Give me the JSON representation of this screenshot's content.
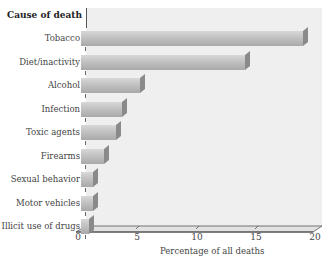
{
  "chart_data": {
    "type": "bar",
    "orientation": "horizontal",
    "style": "3d",
    "title": "",
    "ylabel": "Cause of death",
    "xlabel": "Percentage of all deaths",
    "categories": [
      "Tobacco",
      "Diet/inactivity",
      "Alcohol",
      "Infection",
      "Toxic agents",
      "Firearms",
      "Sexual behavior",
      "Motor vehicles",
      "Illicit use of drugs"
    ],
    "values": [
      19,
      14,
      5,
      3.5,
      3,
      2,
      1,
      1,
      0.7
    ],
    "xlim": [
      0,
      20
    ],
    "xticks": [
      "0",
      "5",
      "10",
      "15",
      "20"
    ],
    "grid": false,
    "legend": null
  },
  "header": "Cause of death",
  "rows": [
    {
      "label": "Tobacco"
    },
    {
      "label": "Diet/inactivity"
    },
    {
      "label": "Alcohol"
    },
    {
      "label": "Infection"
    },
    {
      "label": "Toxic agents"
    },
    {
      "label": "Firearms"
    },
    {
      "label": "Sexual behavior"
    },
    {
      "label": "Motor vehicles"
    },
    {
      "label": "Illicit use of drugs"
    }
  ],
  "axis": {
    "ticks": [
      "0",
      "5",
      "10",
      "15",
      "20"
    ],
    "label": "Percentage of all deaths"
  },
  "colors": {
    "bar_light": "#d8d8d8",
    "bar_dark": "#a9a9a9",
    "bar_side": "#8a8a8a",
    "panel": "#efefef"
  }
}
